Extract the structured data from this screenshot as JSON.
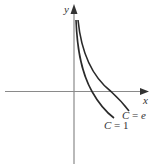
{
  "diagram": {
    "type": "graph-of-curves",
    "axes": {
      "x_label": "x",
      "y_label": "y"
    },
    "curves": [
      {
        "label": "C = 1",
        "label_var": "C",
        "label_eq": " = ",
        "label_val": "1"
      },
      {
        "label": "C = e",
        "label_var": "C",
        "label_eq": " = ",
        "label_val": "e"
      }
    ],
    "colors": {
      "axis": "#888888",
      "curve": "#2a2a2a",
      "text": "#333333"
    }
  }
}
